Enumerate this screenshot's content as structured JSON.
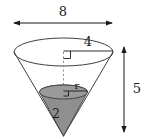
{
  "figure": {
    "type": "geometry-diagram",
    "labels": {
      "top_width": "8",
      "top_radius": "4",
      "total_height": "5",
      "water_height": "2",
      "water_radius": "r"
    },
    "colors": {
      "stroke": "#1a1a1a",
      "outline": "#2b2b2b",
      "water_fill": "#8f8f8f",
      "water_stroke": "#3a3a3a",
      "dashed": "#8a8a8a",
      "background": "#ffffff"
    },
    "geometry": {
      "cone_top_ellipse": {
        "cx": 63.5,
        "cy": 52,
        "rx": 49.5,
        "ry": 14
      },
      "cone_apex": {
        "x": 63.5,
        "y": 136
      },
      "water_ellipse": {
        "cx": 63.5,
        "cy": 92,
        "rx": 24,
        "ry": 7
      },
      "width_arrow": {
        "x1": 13,
        "x2": 113,
        "y": 23
      },
      "height_arrow": {
        "x": 124,
        "y1": 46,
        "y2": 133
      },
      "radius_line": {
        "x1": 63.5,
        "x2": 113,
        "y": 51
      }
    }
  }
}
